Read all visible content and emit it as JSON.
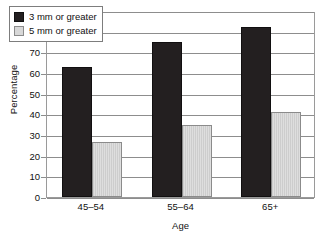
{
  "chart_data": {
    "type": "bar",
    "title": "",
    "subtitle": "",
    "xlabel": "Age",
    "ylabel": "Percentage",
    "categories": [
      "45–54",
      "55–64",
      "65+"
    ],
    "series": [
      {
        "name": "3 mm or greater",
        "color": "#231f20",
        "values": [
          63,
          75,
          82.5
        ]
      },
      {
        "name": "5 mm or greater",
        "color": "#d4d4d4",
        "values": [
          26.5,
          35,
          41
        ]
      }
    ],
    "ylim": [
      0,
      90
    ],
    "ytick_step": 10,
    "yticks": [
      90,
      80,
      70,
      60,
      50,
      40,
      30,
      20,
      10,
      0
    ],
    "ytick_labels": [
      "90",
      "80",
      "70",
      "60",
      "50",
      "40",
      "30",
      "20",
      "10",
      "0"
    ],
    "grid": true,
    "grid_axis": "y",
    "legend_position": "top-left-inside",
    "annotations": []
  },
  "legend": {
    "entries": [
      {
        "label": "3 mm or greater",
        "swatch": "dark"
      },
      {
        "label": "5 mm or greater",
        "swatch": "light"
      }
    ]
  },
  "axes": {
    "y_title": "Percentage",
    "x_title": "Age"
  }
}
